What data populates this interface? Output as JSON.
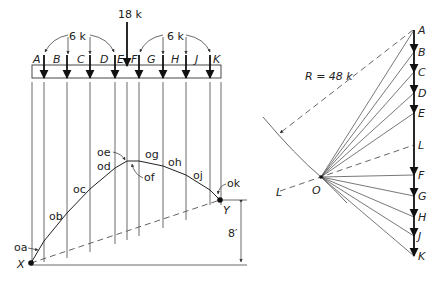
{
  "space_diagram": {
    "beam_labels": [
      "A",
      "B",
      "C",
      "D",
      "E",
      "F",
      "G",
      "H",
      "J",
      "K"
    ],
    "load_groups": [
      {
        "label": "6 k"
      },
      {
        "label": "6 k"
      }
    ],
    "concentrated_load": "18 k",
    "string_labels": [
      "oa",
      "ob",
      "oc",
      "od",
      "oe",
      "of",
      "og",
      "oh",
      "oj",
      "ok"
    ],
    "support_left": "X",
    "support_right": "Y",
    "rise_dimension": "8′"
  },
  "force_polygon": {
    "load_line_labels": [
      "A",
      "B",
      "C",
      "D",
      "E",
      "L",
      "F",
      "G",
      "H",
      "J",
      "K"
    ],
    "pole_label": "O",
    "closing_line_label": "L",
    "resultant_label": "R = 48 k"
  }
}
